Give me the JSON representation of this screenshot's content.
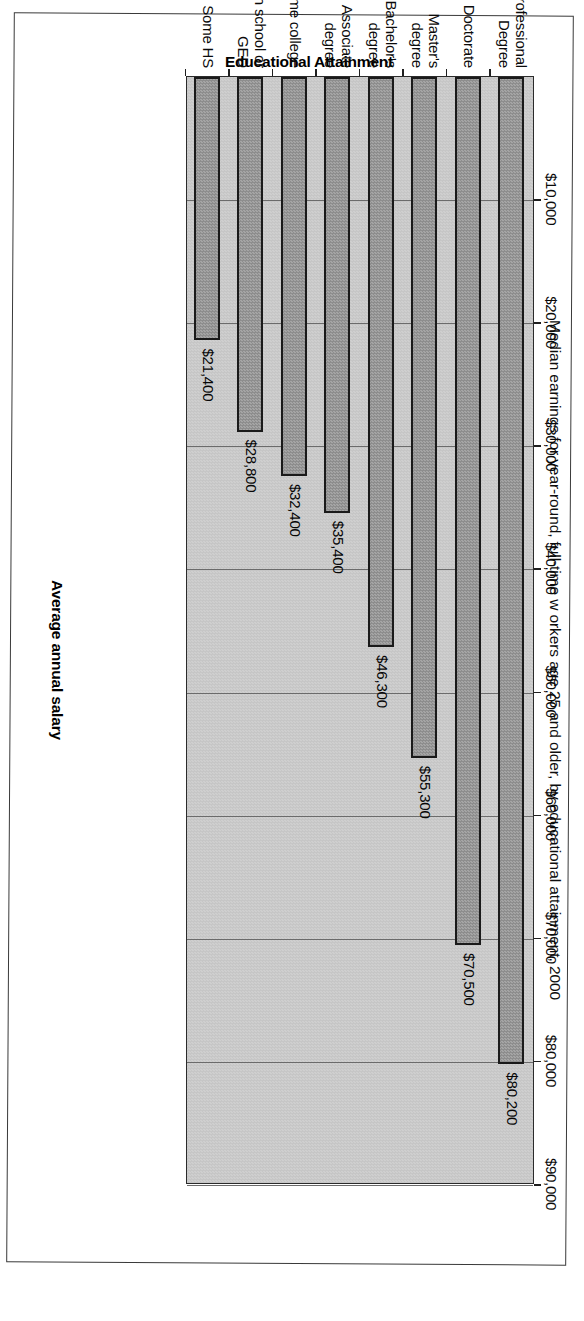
{
  "chart_data": {
    "type": "bar",
    "orientation": "horizontal",
    "title": "Median earnings for year-round, full-time w orkers age 25 and older, by educational attainment, 2000",
    "xlabel": "Average annual salary",
    "ylabel": "Educational Attainment",
    "categories": [
      "Professional Degree",
      "Doctorate",
      "Master's degree",
      "Bachelor's degree",
      "Associate degree",
      "Some college",
      "High school or GED",
      "Some HS"
    ],
    "category_lines": [
      [
        "Professional",
        "Degree"
      ],
      [
        "Doctorate"
      ],
      [
        "Master's",
        "degree"
      ],
      [
        "Bachelor's",
        "degree"
      ],
      [
        "Associate",
        "degree"
      ],
      [
        "Some college"
      ],
      [
        "High school or",
        "GED"
      ],
      [
        "Some HS"
      ]
    ],
    "values": [
      80200,
      70500,
      55300,
      46300,
      35400,
      32400,
      28800,
      21400
    ],
    "value_labels": [
      "$80,200",
      "$70,500",
      "$55,300",
      "$46,300",
      "$35,400",
      "$32,400",
      "$28,800",
      "$21,400"
    ],
    "xlim": [
      0,
      90000
    ],
    "tick_values": [
      10000,
      20000,
      30000,
      40000,
      50000,
      60000,
      70000,
      80000,
      90000
    ],
    "tick_labels": [
      "$10,000",
      "$20,000",
      "$30,000",
      "$40,000",
      "$50,000",
      "$60,000",
      "$70,000",
      "$80,000",
      "$90,000"
    ],
    "grid": true,
    "legend": "none",
    "colors": {
      "bar_fill": "#9a9a9a",
      "bar_border": "#1a1a1a",
      "plot_background": "#c9c9c9",
      "gridline": "#6b6b6b",
      "text": "#0a0a0a"
    }
  }
}
